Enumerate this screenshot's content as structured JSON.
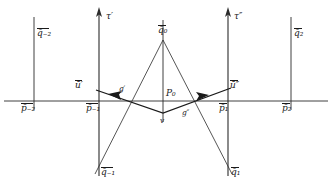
{
  "figure": {
    "type": "geometric-diagram",
    "background_color": "#ffffff",
    "stroke_color": "#2b2b2b",
    "labels": {
      "q_minus2": "q̄₋₂",
      "q_minus1": "q̄₋₁",
      "q_0": "q̄₀",
      "q_1": "q̄₁",
      "q_2": "q̄₂",
      "p_minus2": "p̄₋₂",
      "p_minus1": "p̄₋₁",
      "p_1": "p̄₁",
      "p_2": "p̄₂",
      "P_0": "P₀",
      "v": "v",
      "tau_prime": "τ′",
      "tau_double_prime": "τ″",
      "u_prime": "ū′",
      "u_double_prime": "ū″",
      "g_prime": "g′",
      "g_double_prime": "g″"
    },
    "axis": {
      "orientation": "horizontal",
      "y": 101,
      "x_start": 4,
      "x_end": 328
    },
    "vertical_lines": [
      {
        "name": "line-q-minus2",
        "x": 34,
        "y_top": 17,
        "y_bottom": 110,
        "has_arrow": false
      },
      {
        "name": "line-tau-prime",
        "x": 99,
        "y_top": 9,
        "y_bottom": 176,
        "has_arrow": true
      },
      {
        "name": "line-center",
        "x": 163,
        "y_top": 20,
        "y_bottom": 122,
        "has_arrow": false
      },
      {
        "name": "line-tau-double-prime",
        "x": 228,
        "y_top": 9,
        "y_bottom": 176,
        "has_arrow": true
      },
      {
        "name": "line-q-2",
        "x": 291,
        "y_top": 17,
        "y_bottom": 110,
        "has_arrow": false
      }
    ],
    "diagonals": [
      {
        "name": "diagonal-q0-to-q-minus1",
        "x1": 163,
        "y1": 40,
        "x2": 96,
        "y2": 172
      },
      {
        "name": "diagonal-q0-to-q1",
        "x1": 163,
        "y1": 40,
        "x2": 231,
        "y2": 172
      }
    ],
    "vector_path": {
      "name": "u-vector-chain",
      "points": [
        {
          "x": 231,
          "y": 88
        },
        {
          "x": 163,
          "y": 113
        },
        {
          "x": 96,
          "y": 90
        }
      ],
      "arrowheads": [
        {
          "name": "arrowhead-left",
          "x": 112,
          "y": 95,
          "angle": -161
        },
        {
          "name": "arrowhead-right",
          "x": 204,
          "y": 97,
          "angle": 160
        }
      ]
    }
  }
}
